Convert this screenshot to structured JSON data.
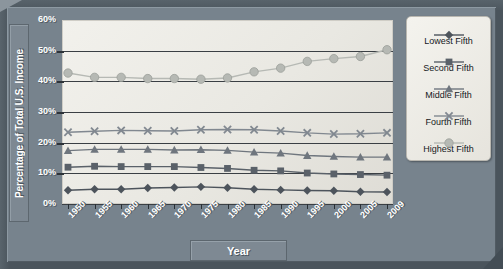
{
  "chart_data": {
    "type": "line",
    "title": "",
    "xlabel": "Year",
    "ylabel": "Percentage of Total U.S. Income",
    "categories": [
      "1950",
      "1955",
      "1960",
      "1965",
      "1970",
      "1975",
      "1980",
      "1985",
      "1990",
      "1995",
      "2000",
      "2005",
      "2009"
    ],
    "ylim": [
      0,
      60
    ],
    "ytick_labels": [
      "0%",
      "10%",
      "20%",
      "30%",
      "40%",
      "50%",
      "60%"
    ],
    "ytick_values": [
      0,
      10,
      20,
      30,
      40,
      50,
      60
    ],
    "grid": true,
    "legend_position": "right",
    "series": [
      {
        "name": "Lowest Fifth",
        "marker": "diamond",
        "color": "#4d545c",
        "values": [
          4.5,
          4.8,
          4.8,
          5.2,
          5.4,
          5.6,
          5.3,
          4.8,
          4.6,
          4.4,
          4.3,
          4.0,
          3.9
        ]
      },
      {
        "name": "Second Fifth",
        "marker": "square",
        "color": "#5a6169",
        "values": [
          12.0,
          12.3,
          12.2,
          12.2,
          12.2,
          11.9,
          11.6,
          11.0,
          10.8,
          10.1,
          9.8,
          9.6,
          9.4
        ]
      },
      {
        "name": "Middle Fifth",
        "marker": "triangle",
        "color": "#6f767e",
        "values": [
          17.4,
          17.8,
          17.8,
          17.8,
          17.6,
          17.7,
          17.5,
          16.9,
          16.6,
          15.8,
          15.5,
          15.3,
          15.3
        ]
      },
      {
        "name": "Fourth Fifth",
        "marker": "x",
        "color": "#818890",
        "values": [
          23.4,
          23.7,
          24.0,
          23.9,
          23.8,
          24.2,
          24.3,
          24.2,
          23.8,
          23.2,
          22.8,
          22.9,
          23.2
        ]
      },
      {
        "name": "Highest Fifth",
        "marker": "circle",
        "color": "#b6b9b4",
        "values": [
          42.7,
          41.3,
          41.3,
          40.9,
          40.9,
          40.7,
          41.1,
          43.1,
          44.3,
          46.5,
          47.4,
          48.1,
          50.3
        ]
      }
    ]
  },
  "legend": {
    "items": [
      {
        "label": "Lowest Fifth"
      },
      {
        "label": "Second Fifth"
      },
      {
        "label": "Middle Fifth"
      },
      {
        "label": "Fourth Fifth"
      },
      {
        "label": "Highest Fifth"
      }
    ]
  },
  "axis": {
    "y_title": "Percentage of Total U.S. Income",
    "x_title": "Year"
  }
}
